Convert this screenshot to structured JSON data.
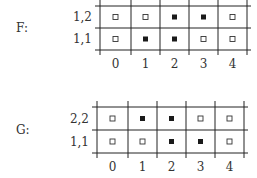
{
  "diagrams": [
    {
      "name": "F",
      "label": "F:",
      "rows": [
        {
          "label": "1,2",
          "cells": [
            false,
            false,
            true,
            true,
            false
          ]
        },
        {
          "label": "1,1",
          "cells": [
            false,
            true,
            true,
            false,
            false
          ]
        }
      ],
      "columns": [
        "0",
        "1",
        "2",
        "3",
        "4"
      ]
    },
    {
      "name": "G",
      "label": "G:",
      "rows": [
        {
          "label": "2,2",
          "cells": [
            false,
            true,
            true,
            false,
            false
          ]
        },
        {
          "label": "1,1",
          "cells": [
            false,
            false,
            true,
            true,
            false
          ]
        }
      ],
      "columns": [
        "0",
        "1",
        "2",
        "3",
        "4"
      ]
    }
  ],
  "colors": {
    "filled": "#1a1a1a",
    "empty_stroke": "#333333",
    "line": "#222222"
  }
}
